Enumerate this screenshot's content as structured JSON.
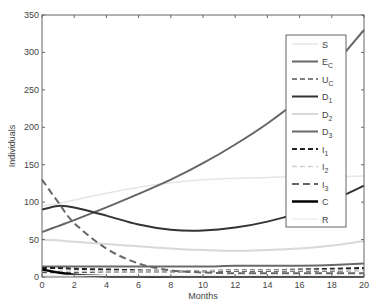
{
  "chart_data": {
    "type": "line",
    "title": "",
    "xlabel": "Months",
    "ylabel": "Individuals",
    "xlim": [
      0,
      20
    ],
    "ylim": [
      0,
      350
    ],
    "xticks": [
      0,
      2,
      4,
      6,
      8,
      10,
      12,
      14,
      16,
      18,
      20
    ],
    "yticks": [
      0,
      50,
      100,
      150,
      200,
      250,
      300,
      350
    ],
    "grid": false,
    "legend_position": "upper right (inside)",
    "x": [
      0,
      1,
      2,
      4,
      6,
      8,
      10,
      12,
      14,
      16,
      18,
      20
    ],
    "series": [
      {
        "name": "S",
        "label_main": "S",
        "label_sub": "",
        "color": "#e6e6e6",
        "dash": "",
        "width": 1.5,
        "values": [
          95,
          98,
          103,
          112,
          120,
          126,
          130,
          132,
          133,
          134,
          134,
          135
        ]
      },
      {
        "name": "E_C",
        "label_main": "E",
        "label_sub": "C",
        "color": "#666666",
        "dash": "",
        "width": 2,
        "values": [
          60,
          68,
          76,
          93,
          111,
          130,
          152,
          177,
          205,
          238,
          280,
          330
        ]
      },
      {
        "name": "U_C",
        "label_main": "U",
        "label_sub": "C",
        "color": "#555555",
        "dash": "5,3",
        "width": 1.5,
        "values": [
          6,
          6,
          6,
          7,
          7,
          7,
          7,
          8,
          8,
          8,
          8,
          9
        ]
      },
      {
        "name": "D_1",
        "label_main": "D",
        "label_sub": "1",
        "color": "#333333",
        "dash": "",
        "width": 2,
        "values": [
          90,
          95,
          93,
          82,
          70,
          63,
          62,
          66,
          74,
          86,
          102,
          122
        ]
      },
      {
        "name": "D_2",
        "label_main": "D",
        "label_sub": "2",
        "color": "#d8d8d8",
        "dash": "",
        "width": 2,
        "values": [
          50,
          49,
          47,
          44,
          41,
          38,
          36,
          35,
          36,
          38,
          42,
          48
        ]
      },
      {
        "name": "D_3",
        "label_main": "D",
        "label_sub": "3",
        "color": "#6a6a6a",
        "dash": "",
        "width": 2,
        "values": [
          14,
          14,
          14,
          14,
          14,
          14,
          14,
          15,
          15,
          15,
          16,
          18
        ]
      },
      {
        "name": "I_1",
        "label_main": "I",
        "label_sub": "1",
        "color": "#222222",
        "dash": "5,3",
        "width": 2,
        "values": [
          12,
          12,
          11,
          10,
          9,
          8,
          8,
          9,
          9,
          10,
          11,
          12
        ]
      },
      {
        "name": "I_2",
        "label_main": "I",
        "label_sub": "2",
        "color": "#cfcfcf",
        "dash": "5,3",
        "width": 1.5,
        "values": [
          8,
          8,
          8,
          8,
          8,
          8,
          8,
          9,
          9,
          9,
          9,
          9
        ]
      },
      {
        "name": "I_3",
        "label_main": "I",
        "label_sub": "3",
        "color": "#666666",
        "dash": "7,4",
        "width": 2,
        "values": [
          130,
          100,
          72,
          38,
          18,
          9,
          6,
          5,
          5,
          5,
          5,
          5
        ]
      },
      {
        "name": "C",
        "label_main": "C",
        "label_sub": "",
        "color": "#000000",
        "dash": "",
        "width": 2.5,
        "values": [
          10,
          6,
          3,
          1,
          0.5,
          0.5,
          0.5,
          0.5,
          0.5,
          0.5,
          0.5,
          0.5
        ]
      },
      {
        "name": "R",
        "label_main": "R",
        "label_sub": "",
        "color": "#eeeeee",
        "dash": "",
        "width": 1.5,
        "values": [
          2,
          2,
          2,
          2,
          2,
          2,
          2,
          2,
          2,
          2,
          2,
          2
        ]
      }
    ]
  }
}
